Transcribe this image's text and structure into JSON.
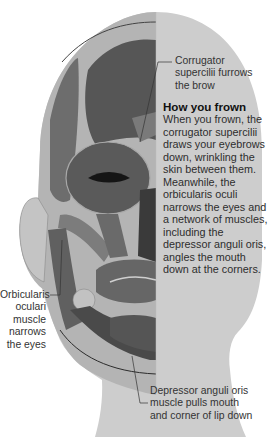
{
  "diagram": {
    "colors": {
      "background": "#ffffff",
      "head_light": "#cfcfcf",
      "head_shadow": "#b5b5b5",
      "muscle_dark": "#4f4f4f",
      "muscle_mid": "#6a6a6a",
      "muscle_light": "#9a9a9a",
      "eye_slit": "#141414",
      "leader_line": "#333333"
    },
    "labels": {
      "corrugator": [
        "Corrugator",
        "supercilii furrows",
        "the brow"
      ],
      "orbicularis": [
        "Orbicularis",
        "oculari",
        "muscle",
        "narrows",
        "the eyes"
      ],
      "depressor": [
        "Depressor anguli oris",
        "muscle pulls mouth",
        "and corner of lip down"
      ]
    },
    "info": {
      "heading": "How you frown",
      "lines": [
        "When you frown, the",
        "corrugator supercilii",
        "draws your eyebrows",
        "down, wrinkling the",
        "skin between them.",
        "Meanwhile, the",
        "orbicularis oculi",
        "narrows the eyes and",
        "a network of muscles,",
        "including the",
        "depressor anguli oris,",
        "angles the mouth",
        "down at the corners."
      ]
    }
  }
}
